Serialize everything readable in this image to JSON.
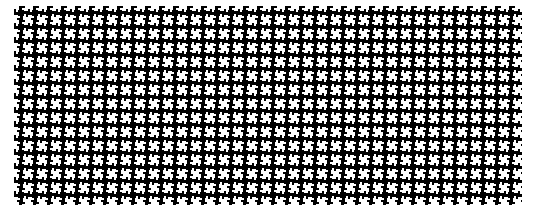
{
  "pattern": {
    "name": "pinwheel-houndstooth",
    "tile_size": 14,
    "foreground": "#000000",
    "background": "#ffffff",
    "area": {
      "x": 14,
      "y": 6,
      "width": 508,
      "height": 199
    }
  }
}
